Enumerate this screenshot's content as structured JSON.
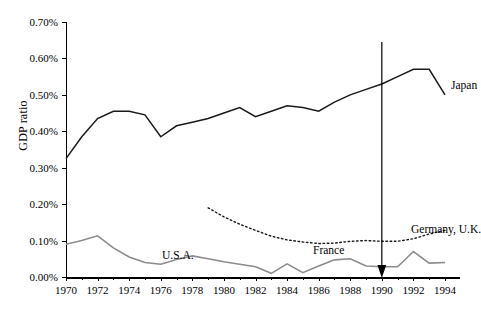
{
  "chart_data": {
    "type": "line",
    "title": "",
    "xlabel": "",
    "ylabel": "GDP ratio",
    "xlim": [
      1970,
      1994
    ],
    "ylim": [
      0.0,
      0.7
    ],
    "ytick_labels": [
      "0.70%",
      "0.60%",
      "0.50%",
      "0.40%",
      "0.30%",
      "0.20%",
      "0.10%",
      "0.00%"
    ],
    "ytick_values": [
      0.7,
      0.6,
      0.5,
      0.4,
      0.3,
      0.2,
      0.1,
      0.0
    ],
    "xtick_labels": [
      "1970",
      "1972",
      "1974",
      "1976",
      "1978",
      "1980",
      "1982",
      "1984",
      "1986",
      "1988",
      "1990",
      "1992",
      "1994"
    ],
    "xtick_values": [
      1970,
      1972,
      1974,
      1976,
      1978,
      1980,
      1982,
      1984,
      1986,
      1988,
      1990,
      1992,
      1994
    ],
    "grid": false,
    "legend_position": "inline-annotations",
    "units": "percent of GDP",
    "x": [
      1970,
      1971,
      1972,
      1973,
      1974,
      1975,
      1976,
      1977,
      1978,
      1979,
      1980,
      1981,
      1982,
      1983,
      1984,
      1985,
      1986,
      1987,
      1988,
      1989,
      1990,
      1991,
      1992,
      1993,
      1994
    ],
    "series": [
      {
        "name": "Japan",
        "style": "solid",
        "color": "#1a1a1a",
        "values": [
          0.325,
          0.385,
          0.435,
          0.455,
          0.455,
          0.445,
          0.385,
          0.415,
          0.425,
          0.435,
          0.45,
          0.465,
          0.44,
          0.455,
          0.47,
          0.465,
          0.455,
          0.48,
          0.5,
          0.515,
          0.53,
          0.55,
          0.57,
          0.57,
          0.5
        ]
      },
      {
        "name": "U.S.A.",
        "style": "solid",
        "color": "#8c8c8c",
        "values": [
          0.09,
          0.1,
          0.113,
          0.08,
          0.055,
          0.04,
          0.035,
          0.048,
          0.058,
          0.05,
          0.042,
          0.035,
          0.028,
          0.01,
          0.036,
          0.012,
          0.03,
          0.047,
          0.05,
          0.03,
          0.028,
          0.028,
          0.07,
          0.038,
          0.04
        ]
      },
      {
        "name": "France",
        "style": "dotted",
        "color": "#1a1a1a",
        "start_year": 1979,
        "values": [
          null,
          null,
          null,
          null,
          null,
          null,
          null,
          null,
          null,
          0.19,
          0.165,
          0.145,
          0.128,
          0.112,
          0.102,
          0.096,
          0.092,
          0.093,
          0.098,
          0.1,
          0.098,
          0.098,
          0.105,
          0.118,
          0.128
        ]
      }
    ],
    "annotations": [
      {
        "name": "japan-label",
        "text": "Japan",
        "target_year": 1992
      },
      {
        "name": "usa-label",
        "text": "U.S.A.",
        "target_year": 1972
      },
      {
        "name": "france-label",
        "text": "France",
        "target_year": 1982
      },
      {
        "name": "germany-uk-label",
        "text": "Germany, U.K.",
        "target_year": 1990,
        "arrow": true,
        "points_to": "baseline near zero"
      }
    ]
  }
}
